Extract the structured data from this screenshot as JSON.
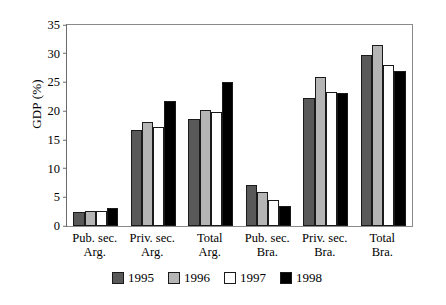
{
  "chart_data": {
    "type": "bar",
    "title": "",
    "xlabel": "",
    "ylabel": "GDP (%)",
    "ylim": [
      0,
      35
    ],
    "ytick_step": 5,
    "yticks": [
      "35",
      "30",
      "25",
      "20",
      "15",
      "10",
      "5",
      "0"
    ],
    "grid": false,
    "legend_position": "bottom",
    "categories": [
      "Pub. sec.\nArg.",
      "Priv. sec.\nArg.",
      "Total\nArg.",
      "Pub. sec.\nBra.",
      "Priv. sec.\nBra.",
      "Total\nBra."
    ],
    "category_lines": [
      {
        "line1": "Pub. sec.",
        "line2": "Arg."
      },
      {
        "line1": "Priv. sec.",
        "line2": "Arg."
      },
      {
        "line1": "Total",
        "line2": "Arg."
      },
      {
        "line1": "Pub. sec.",
        "line2": "Bra."
      },
      {
        "line1": "Priv. sec.",
        "line2": "Bra."
      },
      {
        "line1": "Total",
        "line2": "Bra."
      }
    ],
    "series": [
      {
        "name": "1995",
        "color": "#595959",
        "values": [
          2.5,
          16.7,
          18.6,
          7.2,
          22.3,
          29.8
        ]
      },
      {
        "name": "1996",
        "color": "#b5b5b5",
        "values": [
          2.6,
          18.1,
          20.2,
          5.9,
          26.0,
          31.5
        ]
      },
      {
        "name": "1997",
        "color": "#ffffff",
        "values": [
          2.7,
          17.2,
          19.9,
          4.6,
          23.4,
          28.0
        ]
      },
      {
        "name": "1998",
        "color": "#000000",
        "values": [
          3.1,
          21.8,
          25.0,
          3.5,
          23.2,
          27.0
        ]
      }
    ]
  },
  "legend": {
    "entries": [
      {
        "label": "1995",
        "color": "#595959"
      },
      {
        "label": "1996",
        "color": "#b5b5b5"
      },
      {
        "label": "1997",
        "color": "#ffffff"
      },
      {
        "label": "1998",
        "color": "#000000"
      }
    ]
  }
}
